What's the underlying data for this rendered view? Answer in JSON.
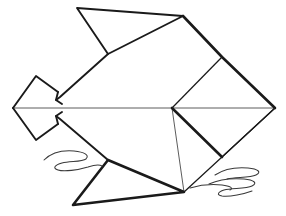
{
  "figure": {
    "style": "line-drawing",
    "background_color": "#ffffff",
    "ink_color": "#1a1a1a",
    "crease_color": "#4a4a4a",
    "water_color": "#3a3a3a",
    "canvas": {
      "width": 286,
      "height": 216
    }
  },
  "geometry": {
    "center_vertex": {
      "x": 172,
      "y": 108
    },
    "body": {
      "name": "fish-body",
      "points": "172,108 183,16 108,54 77,8 42,92 42,108 42,124 73,205 184,192 275,108"
    },
    "parts": [
      {
        "name": "head-diamond",
        "type": "polygon",
        "points": "13,108 36,76 58,92 58,124 36,140"
      },
      {
        "name": "snout-upper-edge",
        "type": "path",
        "d": "M 13,108 L 36,76 L 58,92"
      },
      {
        "name": "snout-lower-edge",
        "type": "path",
        "d": "M 13,108 L 36,140 L 58,124"
      },
      {
        "name": "head-neck-upper",
        "type": "path",
        "d": "M 58,92 L 56,100 L 62,104"
      },
      {
        "name": "head-neck-lower",
        "type": "path",
        "d": "M 58,124 L 56,116 L 62,112"
      },
      {
        "name": "dorsal-fin-triangle",
        "type": "path",
        "d": "M 77,8 L 183,16 L 108,54 Z"
      },
      {
        "name": "body-upper-left-edge",
        "type": "path",
        "d": "M 108,54 L 60,97 L 56,100"
      },
      {
        "name": "body-lower-left-edge",
        "type": "path",
        "d": "M 56,116 L 60,119 L 108,160"
      },
      {
        "name": "ventral-fin-triangle",
        "type": "path",
        "d": "M 108,160 L 73,205 L 184,192 Z"
      },
      {
        "name": "tail-upper-edge",
        "type": "path",
        "d": "M 183,16 L 222,57 L 275,108"
      },
      {
        "name": "tail-lower-edge",
        "type": "path",
        "d": "M 275,108 L 222,157 L 184,192"
      },
      {
        "name": "tail-upper-crease",
        "type": "path",
        "d": "M 172,108 L 222,57"
      },
      {
        "name": "tail-lower-crease",
        "type": "path",
        "d": "M 172,108 L 222,157"
      },
      {
        "name": "body-top-crease",
        "type": "path",
        "d": "M 172,108 L 183,16"
      },
      {
        "name": "body-bottom-crease",
        "type": "path",
        "d": "M 172,108 L 184,192"
      },
      {
        "name": "horizontal-center-crease",
        "type": "path",
        "d": "M 13,108 L 275,108"
      },
      {
        "name": "tail-upper-inner-fold",
        "type": "path",
        "d": "M 222,57 L 275,108"
      },
      {
        "name": "tail-lower-inner-fold",
        "type": "path",
        "d": "M 222,157 L 275,108"
      }
    ],
    "water_marks": [
      {
        "name": "water-squiggle-left",
        "d": "M 44,160 C 52,152 62,150 74,151 C 84,152 90,155 86,159 C 82,162 70,161 62,163 C 55,165 52,168 58,170 C 64,172 78,170 88,167 C 94,165 99,164 102,166"
      },
      {
        "name": "water-squiggle-right-upper",
        "d": "M 215,175 C 224,169 236,167 248,168 C 258,169 262,172 256,175 C 250,178 236,177 227,179"
      },
      {
        "name": "water-squiggle-right-lower",
        "d": "M 209,184 C 218,180 232,178 244,179 C 254,180 258,183 252,186 C 246,189 232,188 224,190 C 218,192 216,195 222,196 C 230,197 244,194 252,191"
      },
      {
        "name": "water-squiggle-right-tail",
        "d": "M 190,188 C 200,185 212,184 222,185 C 230,186 234,188 230,190"
      }
    ]
  }
}
